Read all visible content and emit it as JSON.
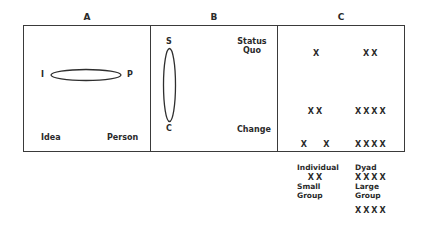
{
  "panels": {
    "A": {
      "letter": "A",
      "left_label": "I",
      "right_label": "P",
      "bottom_left": "Idea",
      "bottom_right": "Person"
    },
    "B": {
      "letter": "B",
      "top_label": "S",
      "bottom_label": "C",
      "top_right": "Status Quo",
      "top_right_line1": "Status",
      "top_right_line2": "Quo",
      "bottom_right": "Change"
    },
    "C": {
      "letter": "C",
      "individual_mark": "X",
      "dyad_mark": "XX",
      "small_group_rows": [
        "XX",
        "X   X",
        "XX"
      ],
      "large_group_rows": [
        "XXXX",
        "XXXX",
        "XXXX",
        "XXXX"
      ]
    }
  },
  "legend": {
    "individual": "Individual",
    "dyad": "Dyad",
    "small_group_line1": "Small",
    "small_group_line2": "Group",
    "large_group_line1": "Large",
    "large_group_line2": "Group"
  },
  "colors": {
    "line": "#3a3a3a",
    "text": "#2a2a2a",
    "background": "#ffffff"
  }
}
